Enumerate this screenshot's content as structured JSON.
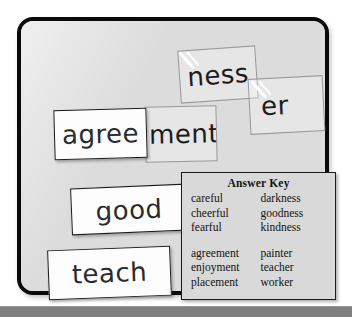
{
  "board": {
    "name": "magnetic-word-board",
    "background_color": "#dcdcdc",
    "border_color": "#0a0a0a"
  },
  "cards": {
    "agree": {
      "text": "agree",
      "state": "placed"
    },
    "ment": {
      "text": "ment",
      "state": "in-motion"
    },
    "ness": {
      "text": "ness",
      "state": "in-motion"
    },
    "er": {
      "text": "er",
      "state": "in-motion"
    },
    "good": {
      "text": "good",
      "state": "placed"
    },
    "teach": {
      "text": "teach",
      "state": "placed"
    }
  },
  "answer_key": {
    "title": "Answer Key",
    "group_one": [
      {
        "left": "careful",
        "right": "darkness"
      },
      {
        "left": "cheerful",
        "right": "goodness"
      },
      {
        "left": "fearful",
        "right": "kindness"
      }
    ],
    "group_two": [
      {
        "left": "agreement",
        "right": "painter"
      },
      {
        "left": "enjoyment",
        "right": "teacher"
      },
      {
        "left": "placement",
        "right": "worker"
      }
    ]
  },
  "bottom_bar": {
    "color": "#7f7f7f"
  }
}
